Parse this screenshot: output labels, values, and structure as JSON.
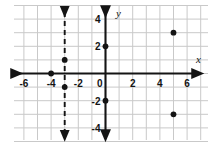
{
  "chart_data": {
    "type": "scatter",
    "title": "",
    "xlabel": "x",
    "ylabel": "y",
    "xlim": [
      -7,
      7
    ],
    "ylim": [
      -5,
      5
    ],
    "grid": true,
    "legend": null,
    "x_ticks": [
      -6,
      -4,
      -2,
      0,
      2,
      4,
      6
    ],
    "y_ticks": [
      4,
      2,
      -2,
      -4
    ],
    "x_tick_labels": [
      "-6",
      "-4",
      "-2",
      "0",
      "2",
      "4",
      "6"
    ],
    "y_tick_labels": [
      "4",
      "2",
      "-2",
      "-4"
    ],
    "points": [
      {
        "x": -4,
        "y": 0
      },
      {
        "x": -3,
        "y": 1
      },
      {
        "x": -3,
        "y": -1
      },
      {
        "x": 0,
        "y": 2
      },
      {
        "x": 0,
        "y": -2
      },
      {
        "x": 5,
        "y": 3
      },
      {
        "x": 5,
        "y": -3
      }
    ],
    "annotations": [
      {
        "kind": "dashed-vertical-line",
        "x": -3,
        "label": "x = -3",
        "arrows": "both"
      }
    ]
  },
  "colors": {
    "background": "#ffffff",
    "grid": "#c9c9c9",
    "axis": "#141414",
    "point": "#141414",
    "dashed_line": "#141414",
    "label": "#141414"
  },
  "axes": {
    "x_axis_label": "x",
    "y_axis_label": "y"
  }
}
